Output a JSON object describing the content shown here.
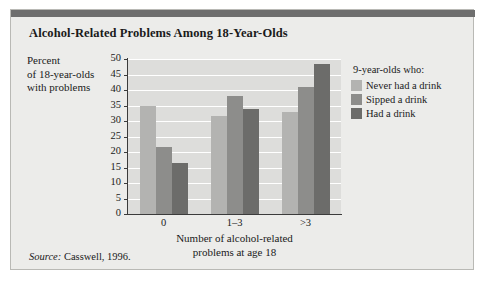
{
  "chart_data": {
    "type": "bar",
    "title": "Alcohol-Related Problems Among 18-Year-Olds",
    "xlabel_lines": [
      "Number of alcohol-related",
      "problems at age 18"
    ],
    "ylabel_lines": [
      "Percent",
      "of 18-year-olds",
      "with problems"
    ],
    "categories": [
      "0",
      "1–3",
      ">3"
    ],
    "yticks": [
      0,
      5,
      10,
      15,
      20,
      25,
      30,
      35,
      40,
      45,
      50
    ],
    "ylim": [
      0,
      50
    ],
    "grid": true,
    "legend_position": "right",
    "legend_title": "9-year-olds who:",
    "series": [
      {
        "name": "Never had a drink",
        "color": "#b3b3b1",
        "values": [
          35,
          31.5,
          33
        ]
      },
      {
        "name": "Sipped a drink",
        "color": "#8d8d8b",
        "values": [
          21.5,
          38,
          41
        ]
      },
      {
        "name": "Had a drink",
        "color": "#6c6c6a",
        "values": [
          16.5,
          34,
          48.5
        ]
      }
    ]
  },
  "source": {
    "label": "Source:",
    "text": " Casswell, 1996."
  }
}
